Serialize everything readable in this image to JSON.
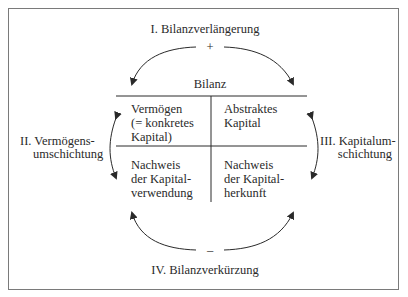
{
  "diagram": {
    "top": {
      "label": "I. Bilanzverlängerung",
      "sign": "+"
    },
    "bottom": {
      "label": "IV. Bilanzverkürzung",
      "sign": "–"
    },
    "left": {
      "line1": "II. Vermögens-",
      "line2": "umschichtung"
    },
    "right": {
      "line1": "III. Kapitalum-",
      "line2": "schichtung"
    },
    "balance": {
      "title": "Bilanz",
      "top_left": [
        "Vermögen",
        "(= konkretes",
        "Kapital)"
      ],
      "top_right": [
        "Abstraktes",
        "Kapital"
      ],
      "bottom_left": [
        "Nachweis",
        "der Kapital-",
        "verwendung"
      ],
      "bottom_right": [
        "Nachweis",
        "der Kapital-",
        "herkunft"
      ]
    }
  },
  "colors": {
    "line": "#2a2a2a",
    "frame": "#7a7a7a"
  }
}
